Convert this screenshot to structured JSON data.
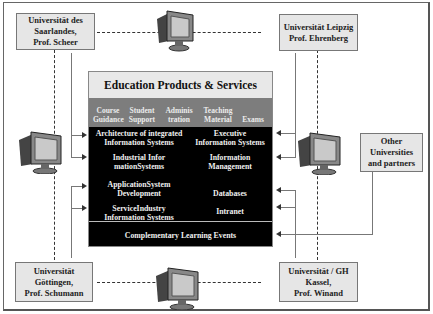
{
  "universities": {
    "saarland": "Universität des\nSaarlandes,\nProf. Scheer",
    "leipzig": "Universität Leipzig\nProf. Ehrenberg",
    "goettingen": "Universität\nGöttingen,\nProf. Schumann",
    "kassel": "Universität / GH\nKassel,\nProf. Winand",
    "other": "Other\nUniversities\nand partners"
  },
  "main": {
    "title": "Education Products  & Services",
    "categories": [
      "Course\nGuidance",
      "Student\nSupport",
      "Adminis\ntration",
      "Teaching\nMaterial",
      "Exams"
    ],
    "left_items": [
      "Architecture of integrated\nInformation Systems",
      "Industrial Infor\nmationSystems",
      "ApplicationSystem\nDevelopment",
      "ServiceIndustry\nInformation Systems"
    ],
    "right_items": [
      "Executive\nInformation Systems",
      "Information\nManagement",
      "Databases",
      "Intranet"
    ],
    "footer": "Complementary Learning Events"
  },
  "icons": {
    "monitor": "computer-monitor-icon"
  }
}
